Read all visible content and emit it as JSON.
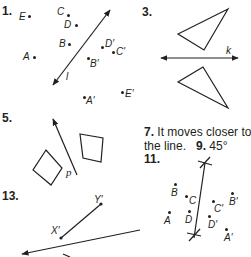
{
  "exercises": {
    "ex1": {
      "number": "1.",
      "line_label": "l",
      "points": [
        {
          "label": "E",
          "x": 29,
          "y": 16,
          "lx": 19,
          "ly": 11
        },
        {
          "label": "C",
          "x": 68,
          "y": 15,
          "lx": 57,
          "ly": 6
        },
        {
          "label": "D",
          "x": 76,
          "y": 25,
          "lx": 64,
          "ly": 19
        },
        {
          "label": "B",
          "x": 69,
          "y": 44,
          "lx": 59,
          "ly": 38
        },
        {
          "label": "A",
          "x": 34,
          "y": 57,
          "lx": 23,
          "ly": 51
        },
        {
          "label": "D′",
          "x": 102,
          "y": 47,
          "lx": 105,
          "ly": 38
        },
        {
          "label": "C′",
          "x": 113,
          "y": 52,
          "lx": 116,
          "ly": 46
        },
        {
          "label": "B′",
          "x": 88,
          "y": 58,
          "lx": 90,
          "ly": 58
        },
        {
          "label": "A′",
          "x": 84,
          "y": 97,
          "lx": 86,
          "ly": 95
        },
        {
          "label": "E′",
          "x": 122,
          "y": 92,
          "lx": 125,
          "ly": 88
        }
      ]
    },
    "ex3": {
      "number": "3.",
      "line_label": "k"
    },
    "ex5": {
      "number": "5.",
      "line_label": "p"
    },
    "ex7": {
      "number": "7.",
      "answer_line1": "It moves closer to",
      "answer_line2": "the line."
    },
    "ex9": {
      "number": "9.",
      "answer": "45°"
    },
    "ex11": {
      "number": "11.",
      "points": [
        {
          "label": "B",
          "x": 175,
          "y": 184,
          "lx": 171,
          "ly": 187
        },
        {
          "label": "C",
          "x": 186,
          "y": 196,
          "lx": 189,
          "ly": 195
        },
        {
          "label": "A",
          "x": 169,
          "y": 212,
          "lx": 164,
          "ly": 215
        },
        {
          "label": "D",
          "x": 189,
          "y": 211,
          "lx": 185,
          "ly": 214
        },
        {
          "label": "C′",
          "x": 213,
          "y": 201,
          "lx": 214,
          "ly": 203
        },
        {
          "label": "B′",
          "x": 232,
          "y": 193,
          "lx": 229,
          "ly": 196
        },
        {
          "label": "D′",
          "x": 209,
          "y": 216,
          "lx": 208,
          "ly": 219
        },
        {
          "label": "A′",
          "x": 226,
          "y": 229,
          "lx": 224,
          "ly": 232
        }
      ]
    },
    "ex13": {
      "number": "13.",
      "seg_start": "X′",
      "seg_end": "Y′"
    }
  }
}
